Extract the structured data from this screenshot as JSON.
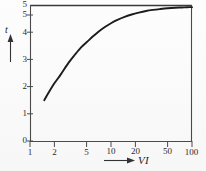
{
  "figure": {
    "kind": "semilog-chart",
    "width": 206,
    "height": 171,
    "background_color": "#fdfdfd",
    "ink_color": "#2b2b2b"
  },
  "axes": {
    "y_axis_label": "t",
    "y_axis_arrow": "↑",
    "x_axis_label": "VI",
    "x_axis_arrow": "⟶"
  },
  "y_ticks": [
    {
      "value": 5,
      "label": "5",
      "is_axis_cap": true
    },
    {
      "value": 5,
      "label": "5"
    },
    {
      "value": 4,
      "label": "4"
    },
    {
      "value": 3,
      "label": "3"
    },
    {
      "value": 2,
      "label": "2"
    },
    {
      "value": 1,
      "label": "1"
    },
    {
      "value": 0,
      "label": "0"
    }
  ],
  "x_ticks": [
    {
      "value": 1,
      "label": "1"
    },
    {
      "value": 2,
      "label": "2"
    },
    {
      "value": 5,
      "label": "5"
    },
    {
      "value": 10,
      "label": "10"
    },
    {
      "value": 20,
      "label": "20"
    },
    {
      "value": 50,
      "label": "50"
    },
    {
      "value": 100,
      "label": "100"
    }
  ],
  "chart_data": {
    "type": "line",
    "title": "",
    "subtitle": "",
    "xlabel": "VI",
    "ylabel": "t",
    "xscale": "log",
    "yscale": "linear",
    "xlim": [
      1,
      100
    ],
    "ylim": [
      0,
      5
    ],
    "grid": false,
    "legend": null,
    "legend_position": null,
    "annotations": [],
    "series": [
      {
        "name": "t(VI)",
        "x": [
          1.5,
          1.7,
          2.0,
          2.4,
          3.0,
          3.6,
          4.3,
          5.0,
          6.0,
          7.0,
          8.5,
          10.0,
          12.0,
          15.0,
          18.0,
          22.0,
          27.0,
          33.0,
          40.0,
          50.0,
          62.0,
          75.0,
          88.0,
          100.0
        ],
        "y": [
          1.5,
          1.78,
          2.12,
          2.45,
          2.88,
          3.18,
          3.45,
          3.63,
          3.85,
          4.02,
          4.2,
          4.33,
          4.45,
          4.57,
          4.65,
          4.72,
          4.78,
          4.82,
          4.85,
          4.88,
          4.9,
          4.91,
          4.92,
          4.92
        ]
      }
    ]
  },
  "geometry": {
    "plot_left": 30,
    "plot_right": 192,
    "plot_top": 5,
    "plot_bottom": 141
  }
}
